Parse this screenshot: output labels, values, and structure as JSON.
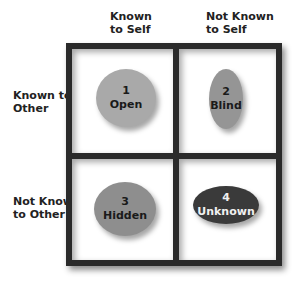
{
  "columns": [
    {
      "label_line1": "Known",
      "label_line2": "to Self"
    },
    {
      "label_line1": "Not Known",
      "label_line2": "to Self"
    }
  ],
  "rows": [
    {
      "label_line1": "Known to",
      "label_line2": "Other"
    },
    {
      "label_line1": "Not Known",
      "label_line2": "to Other"
    }
  ],
  "quadrants": [
    {
      "number": "1",
      "name": "Open",
      "fill": "#a9a9a9",
      "text_color": "#1a1a1a"
    },
    {
      "number": "2",
      "name": "Blind",
      "fill": "#959595",
      "text_color": "#1a1a1a"
    },
    {
      "number": "3",
      "name": "Hidden",
      "fill": "#8e8e8e",
      "text_color": "#1a1a1a"
    },
    {
      "number": "4",
      "name": "Unknown",
      "fill": "#3a3a3a",
      "text_color": "#f0f0f0"
    }
  ],
  "colors": {
    "frame": "#2a2a2a",
    "cell_bg": "#ffffff"
  }
}
